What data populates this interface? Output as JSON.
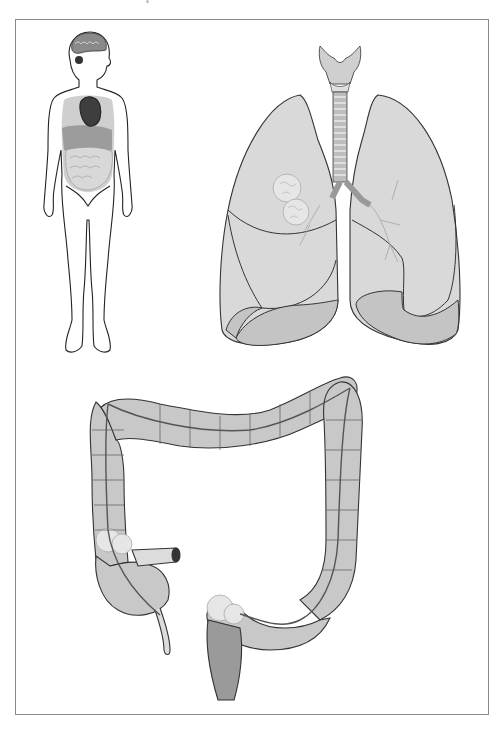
{
  "figure": {
    "title": "",
    "caption": "",
    "panels": [
      {
        "id": "body",
        "label": "Human body with internal organs"
      },
      {
        "id": "lungs",
        "label": "Lungs with trachea and larynx, tumor in right upper lobe"
      },
      {
        "id": "colon",
        "label": "Large intestine (colon) with tumors at cecum and sigmoid/rectum"
      }
    ]
  },
  "colors": {
    "outline": "#333333",
    "organ_fill": "#c8c8c8",
    "organ_fill_light": "#dcdcdc",
    "organ_fill_dark": "#9a9a9a",
    "heart": "#4a4a4a",
    "frame": "#8a8a8a",
    "tumor": "#e8e8e8"
  }
}
